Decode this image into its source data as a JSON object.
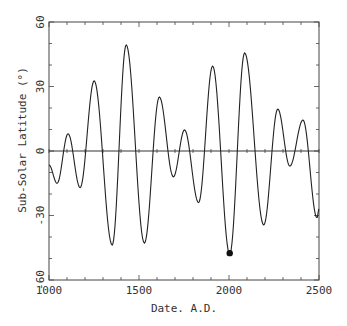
{
  "chart_data": {
    "type": "line",
    "title": "",
    "xlabel": "Date. A.D.",
    "ylabel": "Sub-Solar Latitude (°)",
    "xlim": [
      1000,
      2500
    ],
    "ylim": [
      -60,
      60
    ],
    "xticks": [
      1000,
      1500,
      2000,
      2500
    ],
    "xtick_labels": [
      "1000",
      "1500",
      "2000",
      "2500"
    ],
    "x_minor_step": 100,
    "yticks": [
      -60,
      -30,
      0,
      30,
      60
    ],
    "ytick_labels": [
      "-60",
      "-30",
      "0",
      "30",
      "60"
    ],
    "y_minor_step": 10,
    "grid": false,
    "zero_line": true,
    "series": [
      {
        "name": "sub-solar latitude",
        "extrema_points": [
          [
            1000,
            -6.5
          ],
          [
            1045,
            -15
          ],
          [
            1106,
            8
          ],
          [
            1173,
            -17
          ],
          [
            1251,
            32.6
          ],
          [
            1351,
            -43.7
          ],
          [
            1429,
            49.3
          ],
          [
            1530,
            -42.8
          ],
          [
            1613,
            25.1
          ],
          [
            1691,
            -12
          ],
          [
            1753,
            9.8
          ],
          [
            1831,
            -24
          ],
          [
            1909,
            39.5
          ],
          [
            2004,
            -48
          ],
          [
            2087,
            45.6
          ],
          [
            2193,
            -34.4
          ],
          [
            2271,
            19.5
          ],
          [
            2338,
            -7
          ],
          [
            2411,
            14.4
          ],
          [
            2489,
            -31
          ],
          [
            2500,
            -27
          ]
        ]
      }
    ],
    "annotations": [
      {
        "type": "marker",
        "x": 2004,
        "y": -47.5,
        "label": ""
      }
    ]
  },
  "colors": {
    "line": "#222222",
    "axis": "#444444",
    "marker": "#111111"
  }
}
